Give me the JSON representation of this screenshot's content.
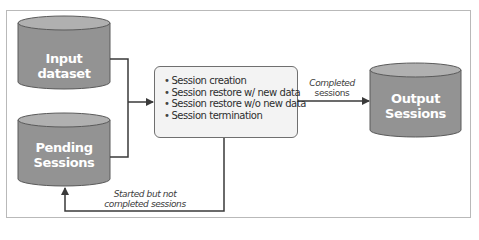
{
  "diagram": {
    "nodes": {
      "input_dataset": {
        "label": "Input dataset",
        "shape": "cylinder"
      },
      "pending_sessions": {
        "label_line1": "Pending",
        "label_line2": "Sessions",
        "shape": "cylinder"
      },
      "processor": {
        "shape": "rounded-rectangle",
        "items": [
          "Session creation",
          "Session restore w/ new data",
          "Session restore w/o new data",
          "Session termination"
        ]
      },
      "output_sessions": {
        "label_line1": "Output",
        "label_line2": "Sessions",
        "shape": "cylinder"
      }
    },
    "edges": {
      "completed": {
        "from": "processor",
        "to": "output_sessions",
        "label_line1": "Completed",
        "label_line2": "sessions"
      },
      "incomplete": {
        "from": "processor",
        "to": "pending_sessions",
        "label_line1": "Started but not",
        "label_line2": "completed sessions"
      },
      "input_to_processor": {
        "from": "input_dataset",
        "to": "processor"
      },
      "pending_to_processor": {
        "from": "pending_sessions",
        "to": "processor"
      }
    },
    "colors": {
      "cylinder_body": "#939393",
      "cylinder_top": "#b0b0b0",
      "cylinder_stroke": "#5a5a5a",
      "line": "#3a3a3a",
      "box_fill": "#f3f3f3",
      "frame": "#b9b9b9"
    }
  }
}
